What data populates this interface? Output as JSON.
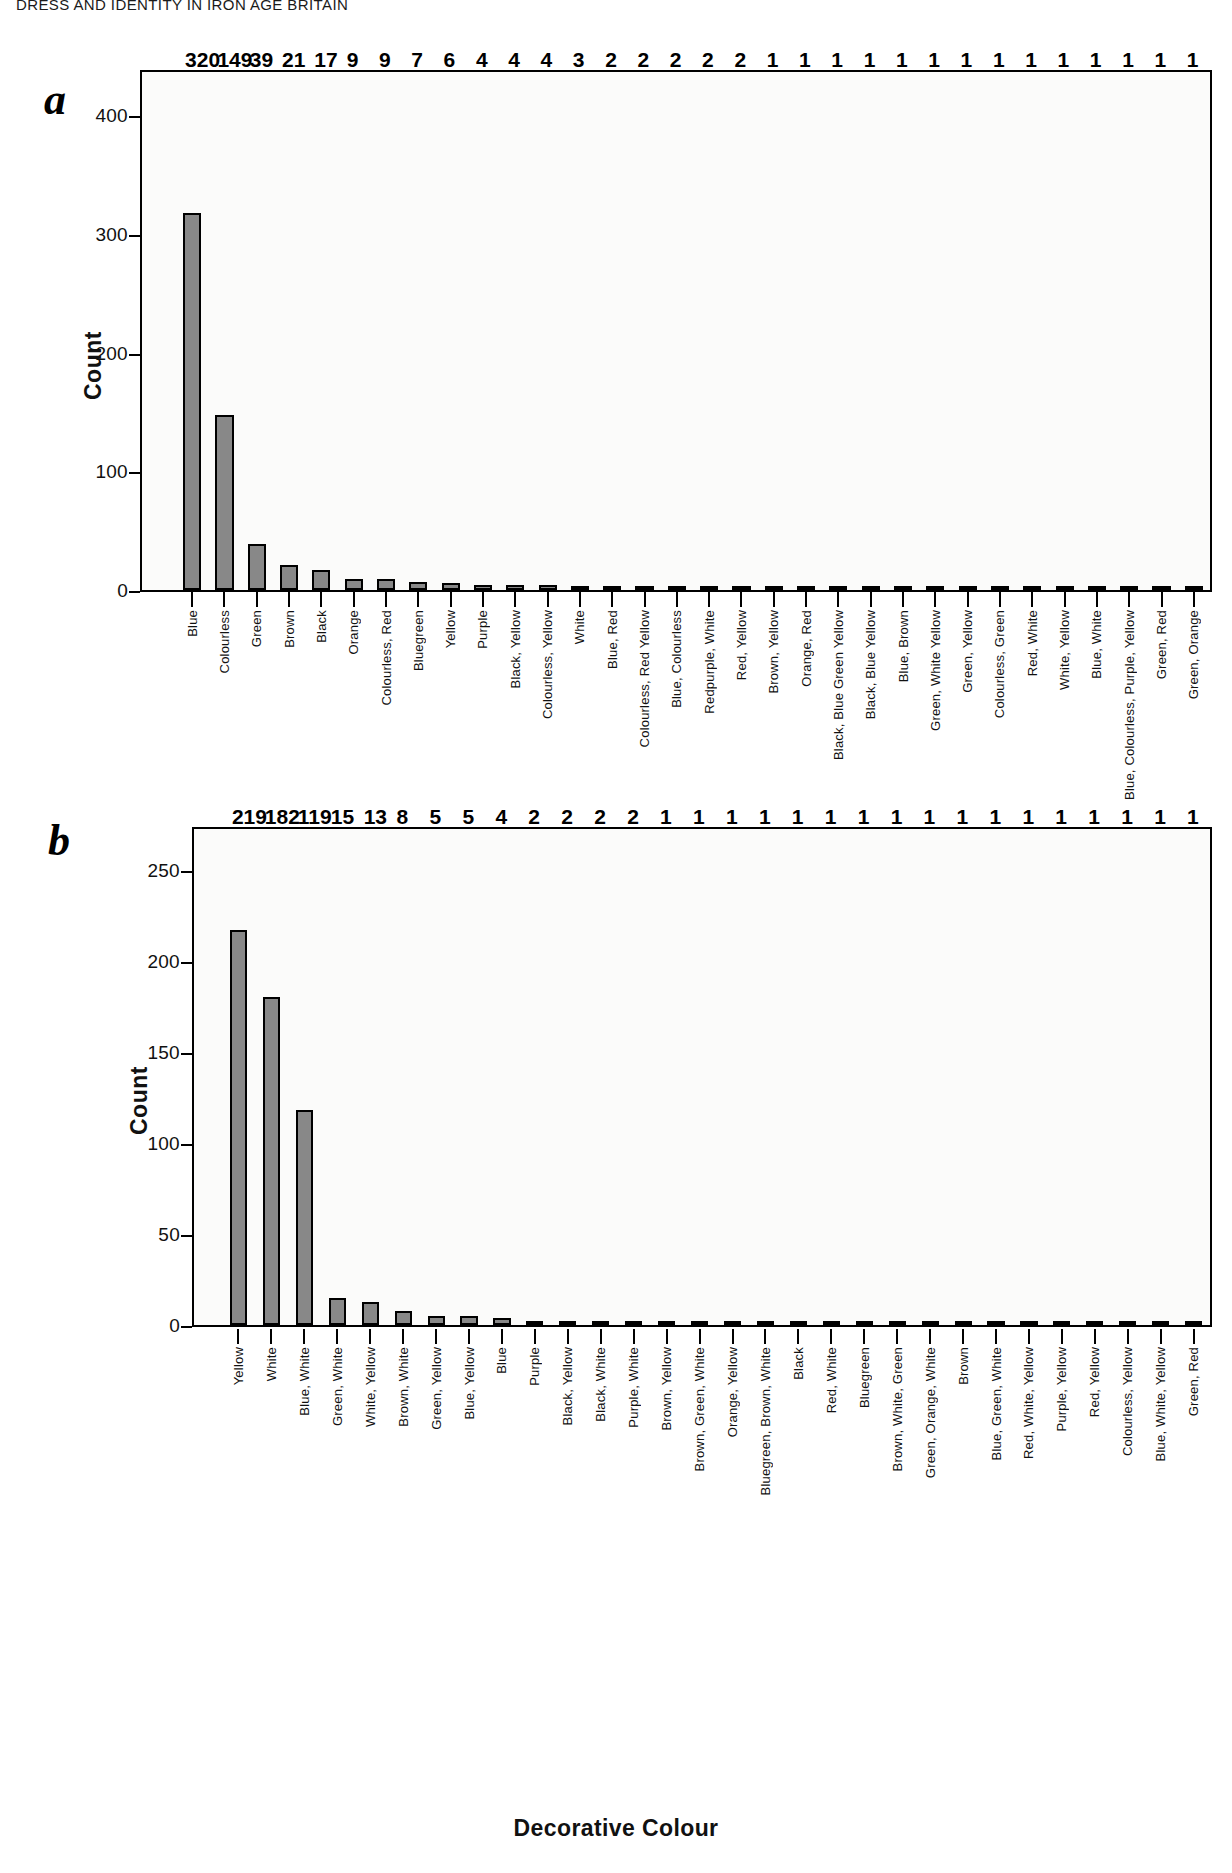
{
  "running_head": "DRESS AND IDENTITY IN IRON AGE BRITAIN",
  "figure": {
    "panel_a_letter": "a",
    "panel_b_letter": "b"
  },
  "colors": {
    "bar_fill": "#888888",
    "bar_stroke": "#000000",
    "plot_background": "#fbfbfa",
    "text": "#111111"
  },
  "chart_data": [
    {
      "type": "bar",
      "title": "",
      "panel": "a",
      "xlabel": "Body Colour",
      "ylabel": "Count",
      "ylim": [
        0,
        440
      ],
      "yticks": [
        0,
        100,
        200,
        300,
        400
      ],
      "ytick_labels": [
        "0",
        "100",
        "200",
        "300",
        "400"
      ],
      "grid": false,
      "legend": "none",
      "categories": [
        "Blue",
        "Colourless",
        "Green",
        "Brown",
        "Black",
        "Orange",
        "Colourless, Red",
        "Bluegreen",
        "Yellow",
        "Purple",
        "Black, Yellow",
        "Colourless, Yellow",
        "White",
        "Blue, Red",
        "Colourless, Red Yellow",
        "Blue, Colourless",
        "Redpurple, White",
        "Red, Yellow",
        "Brown, Yellow",
        "Orange, Red",
        "Black, Blue Green Yellow",
        "Black, Blue Yellow",
        "Blue, Brown",
        "Green, White Yellow",
        "Green, Yellow",
        "Colourless, Green",
        "Red, White",
        "White, Yellow",
        "Blue, White",
        "Blue, Colourless, Purple, Yellow",
        "Green, Red",
        "Green, Orange"
      ],
      "values": [
        320,
        149,
        39,
        21,
        17,
        9,
        9,
        7,
        6,
        4,
        4,
        4,
        3,
        2,
        2,
        2,
        2,
        2,
        1,
        1,
        1,
        1,
        1,
        1,
        1,
        1,
        1,
        1,
        1,
        1,
        1,
        1
      ]
    },
    {
      "type": "bar",
      "title": "",
      "panel": "b",
      "xlabel": "Decorative Colour",
      "ylabel": "Count",
      "ylim": [
        0,
        275
      ],
      "yticks": [
        0,
        50,
        100,
        150,
        200,
        250
      ],
      "ytick_labels": [
        "0",
        "50",
        "100",
        "150",
        "200",
        "250"
      ],
      "grid": false,
      "legend": "none",
      "categories": [
        "Yellow",
        "White",
        "Blue, White",
        "Green, White",
        "White, Yellow",
        "Brown, White",
        "Green, Yellow",
        "Blue, Yellow",
        "Blue",
        "Purple",
        "Black, Yellow",
        "Black, White",
        "Purple, White",
        "Brown, Yellow",
        "Brown, Green, White",
        "Orange, Yellow",
        "Bluegreen, Brown, White",
        "Black",
        "Red, White",
        "Bluegreen",
        "Brown, White, Green",
        "Green, Orange, White",
        "Brown",
        "Blue, Green, White",
        "Red, White, Yellow",
        "Purple, Yellow",
        "Red, Yellow",
        "Colourless, Yellow",
        "Blue, White, Yellow",
        "Green, Red"
      ],
      "values": [
        219,
        182,
        119,
        15,
        13,
        8,
        5,
        5,
        4,
        2,
        2,
        2,
        2,
        1,
        1,
        1,
        1,
        1,
        1,
        1,
        1,
        1,
        1,
        1,
        1,
        1,
        1,
        1,
        1,
        1
      ]
    }
  ]
}
